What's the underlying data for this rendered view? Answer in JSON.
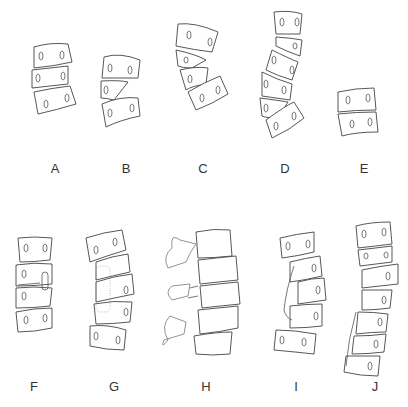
{
  "figure": {
    "panels": [
      {
        "id": "A",
        "label": "A",
        "vertebrae": 3
      },
      {
        "id": "B",
        "label": "B",
        "vertebrae": 3
      },
      {
        "id": "C",
        "label": "C",
        "vertebrae": 4
      },
      {
        "id": "D",
        "label": "D",
        "vertebrae": 6
      },
      {
        "id": "E",
        "label": "E",
        "vertebrae": 2
      },
      {
        "id": "F",
        "label": "F",
        "vertebrae": 4
      },
      {
        "id": "G",
        "label": "G",
        "vertebrae": 5
      },
      {
        "id": "H",
        "label": "H",
        "vertebrae": 5
      },
      {
        "id": "I",
        "label": "I",
        "vertebrae": 4
      },
      {
        "id": "J",
        "label": "J",
        "vertebrae": 7
      }
    ]
  }
}
